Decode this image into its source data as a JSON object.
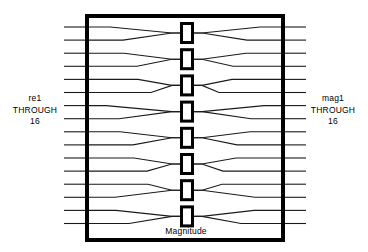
{
  "diagram": {
    "title": "Magnitude",
    "caption": "Magnitude",
    "type": "signal-routing-block-diagram",
    "background_color": "#ffffff",
    "line_color": "#1a1a1a",
    "border_color": "#000000"
  },
  "input_label": {
    "name": "re1",
    "connector": "THROUGH",
    "last": "16"
  },
  "output_label": {
    "name": "mag1",
    "connector": "THROUGH",
    "last": "16"
  },
  "block": {
    "x": 85,
    "y": 14,
    "width": 200,
    "height": 228,
    "stroke_width": 4
  },
  "ports": {
    "count": 16,
    "left_stub_x": 64,
    "right_stub_x": 306,
    "first_y": 27,
    "spacing": 13.1
  },
  "cells": {
    "count": 8,
    "label": "magnitude-comparator-cell",
    "x": 180,
    "width": 14,
    "height": 22,
    "first_y": 22,
    "spacing": 26.2,
    "stroke_width": 3
  },
  "routing": {
    "description": "butterfly shuffle network pairing 16 inputs into 8 magnitude cells and fanning back out to 16 outputs",
    "left_pairs": [
      [
        1,
        1
      ],
      [
        2,
        1
      ],
      [
        3,
        2
      ],
      [
        4,
        2
      ],
      [
        5,
        3
      ],
      [
        6,
        3
      ],
      [
        7,
        4
      ],
      [
        8,
        4
      ],
      [
        9,
        5
      ],
      [
        10,
        5
      ],
      [
        11,
        6
      ],
      [
        12,
        6
      ],
      [
        13,
        7
      ],
      [
        14,
        7
      ],
      [
        15,
        8
      ],
      [
        16,
        8
      ]
    ],
    "right_pairs": [
      [
        1,
        1
      ],
      [
        1,
        2
      ],
      [
        2,
        3
      ],
      [
        2,
        4
      ],
      [
        3,
        5
      ],
      [
        3,
        6
      ],
      [
        4,
        7
      ],
      [
        4,
        8
      ],
      [
        5,
        9
      ],
      [
        5,
        10
      ],
      [
        6,
        11
      ],
      [
        6,
        12
      ],
      [
        7,
        13
      ],
      [
        7,
        14
      ],
      [
        8,
        15
      ],
      [
        8,
        16
      ]
    ]
  },
  "chart_data": {
    "type": "diagram",
    "title": "Magnitude",
    "inputs": [
      "re1",
      "re2",
      "re3",
      "re4",
      "re5",
      "re6",
      "re7",
      "re8",
      "re9",
      "re10",
      "re11",
      "re12",
      "re13",
      "re14",
      "re15",
      "re16"
    ],
    "outputs": [
      "mag1",
      "mag2",
      "mag3",
      "mag4",
      "mag5",
      "mag6",
      "mag7",
      "mag8",
      "mag9",
      "mag10",
      "mag11",
      "mag12",
      "mag13",
      "mag14",
      "mag15",
      "mag16"
    ],
    "cells": [
      "magnitude-1",
      "magnitude-2",
      "magnitude-3",
      "magnitude-4",
      "magnitude-5",
      "magnitude-6",
      "magnitude-7",
      "magnitude-8"
    ]
  }
}
